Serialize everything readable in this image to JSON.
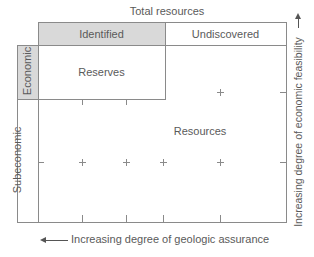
{
  "diagram": {
    "title": "Total resources",
    "column_headers": {
      "identified": "Identified",
      "undiscovered": "Undiscovered"
    },
    "row_headers": {
      "economic": "Economic",
      "subeconomic": "Subeconomic"
    },
    "regions": {
      "reserves": "Reserves",
      "resources": "Resources"
    },
    "axes": {
      "x_label": "Increasing degree of geologic assurance",
      "x_arrow": "left",
      "y_label": "Increasing degree of economic feasibility",
      "y_arrow": "up"
    },
    "colors": {
      "shade": "#d9d9d9",
      "line": "#8a8a8a",
      "text": "#5a5a5a"
    }
  }
}
